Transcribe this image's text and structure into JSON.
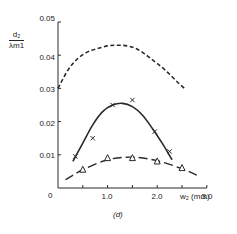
{
  "chart_data": {
    "type": "line",
    "title": "",
    "panel_label": "(d)",
    "xlabel": "w2 (mm)",
    "ylabel": "d2 / λm1",
    "ylabel_numerator": "d2",
    "ylabel_denominator": "λm1",
    "xlim": [
      0,
      3.0
    ],
    "ylim": [
      0,
      0.05
    ],
    "x_ticks": [
      0,
      0.5,
      1.0,
      1.5,
      2.0,
      2.5,
      3.0
    ],
    "x_tick_labels": [
      "0",
      "1.0",
      "2.0",
      "3.0"
    ],
    "y_tick_labels": [
      "0.05",
      "0.04",
      "0.03",
      "0.02",
      "0.01"
    ],
    "y_ticks": [
      0.01,
      0.02,
      0.03,
      0.04,
      0.05
    ],
    "origin_label": "0",
    "grid": false,
    "legend": "none",
    "series": [
      {
        "name": "dashed theoretical curve",
        "style": "dashed",
        "marker": "none",
        "x": [
          0.0,
          0.2,
          0.4,
          0.6,
          0.8,
          1.0,
          1.2,
          1.4,
          1.6,
          1.8,
          2.0,
          2.2,
          2.4,
          2.55
        ],
        "y": [
          0.03,
          0.0355,
          0.039,
          0.041,
          0.042,
          0.0428,
          0.043,
          0.0428,
          0.0418,
          0.0398,
          0.0375,
          0.035,
          0.032,
          0.03
        ]
      },
      {
        "name": "x markers (solid fit)",
        "style": "solid",
        "marker": "x",
        "points_x": [
          0.35,
          0.7,
          1.1,
          1.5,
          1.95,
          2.25
        ],
        "points_y": [
          0.0095,
          0.015,
          0.025,
          0.0265,
          0.017,
          0.011
        ],
        "curve_x": [
          0.3,
          0.5,
          0.7,
          0.9,
          1.1,
          1.3,
          1.5,
          1.7,
          1.9,
          2.1,
          2.3
        ],
        "curve_y": [
          0.008,
          0.0135,
          0.019,
          0.023,
          0.025,
          0.0255,
          0.0245,
          0.022,
          0.018,
          0.0135,
          0.0085
        ]
      },
      {
        "name": "triangle markers (long-dash fit)",
        "style": "long-dash",
        "marker": "triangle",
        "points_x": [
          0.5,
          1.0,
          1.5,
          2.0,
          2.5
        ],
        "points_y": [
          0.0055,
          0.009,
          0.009,
          0.008,
          0.006
        ],
        "curve_x": [
          0.15,
          0.5,
          1.0,
          1.5,
          2.0,
          2.5,
          2.85
        ],
        "curve_y": [
          0.0025,
          0.0055,
          0.0085,
          0.0093,
          0.0082,
          0.0058,
          0.0035
        ]
      }
    ]
  },
  "labels": {
    "y_ticks": [
      "0.05",
      "0.04",
      "0.03",
      "0.02",
      "0.01"
    ],
    "x_ticks": [
      "1.0",
      "2.0",
      "3.0"
    ],
    "origin": "0",
    "xlabel": "w₂ (mm)",
    "ylabel_num": "d₂",
    "ylabel_den": "λm1",
    "panel": "(d)"
  }
}
